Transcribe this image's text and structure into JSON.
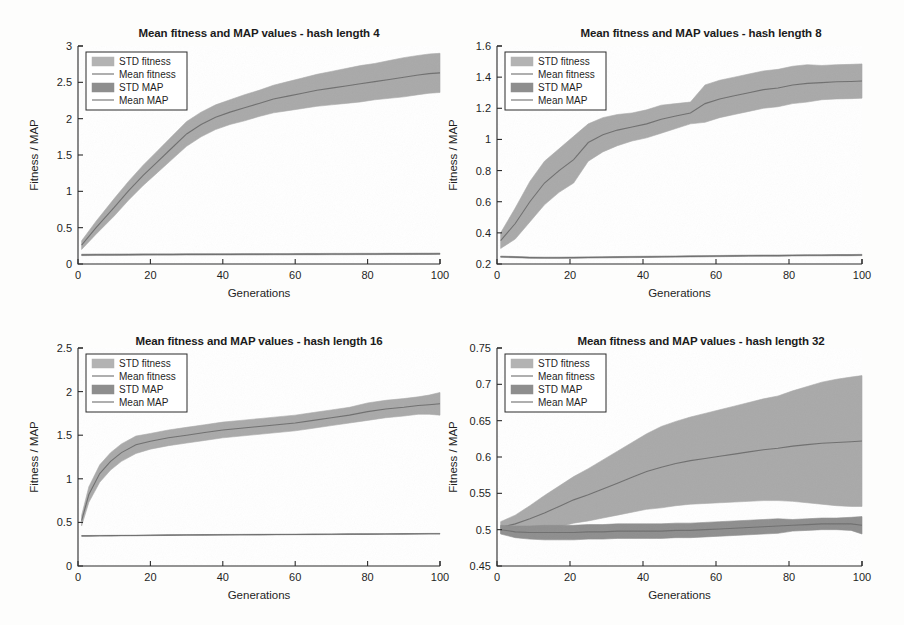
{
  "figure": {
    "background_color": "#fdfdfc",
    "panel_count": 4,
    "layout": "2x2 grid"
  },
  "style": {
    "band_fitness_color": "#a9a9a9",
    "band_map_color": "#8e8e8e",
    "mean_line_color": "#6f6f6f",
    "axis_color": "#2b2b2b",
    "plot_background": "#ffffff"
  },
  "legend": {
    "entries": [
      {
        "label": "STD fitness",
        "type": "patch",
        "color": "#b3b3b3"
      },
      {
        "label": "Mean fitness",
        "type": "line",
        "color": "#7a7a7a"
      },
      {
        "label": "STD MAP",
        "type": "patch",
        "color": "#8e8e8e"
      },
      {
        "label": "Mean MAP",
        "type": "line",
        "color": "#7a7a7a"
      }
    ],
    "position": "upper-left"
  },
  "chart_data": [
    {
      "id": "hash-length-4",
      "type": "area",
      "title": "Mean fitness and MAP values - hash length 4",
      "xlabel": "Generations",
      "ylabel": "Fitness / MAP",
      "xlim": [
        0,
        100
      ],
      "ylim": [
        0,
        3
      ],
      "xticks": [
        0,
        20,
        40,
        60,
        80,
        100
      ],
      "yticks": [
        0,
        0.5,
        1,
        1.5,
        2,
        2.5,
        3
      ],
      "grid": false,
      "x": [
        1,
        5,
        10,
        14,
        18,
        22,
        26,
        30,
        34,
        38,
        42,
        46,
        50,
        54,
        58,
        62,
        66,
        70,
        74,
        78,
        82,
        86,
        90,
        94,
        97,
        100
      ],
      "series": [
        {
          "name": "Mean fitness",
          "values": [
            0.26,
            0.5,
            0.78,
            1.01,
            1.22,
            1.41,
            1.6,
            1.79,
            1.92,
            2.02,
            2.09,
            2.15,
            2.21,
            2.27,
            2.31,
            2.35,
            2.39,
            2.42,
            2.45,
            2.48,
            2.51,
            2.54,
            2.57,
            2.6,
            2.62,
            2.63
          ],
          "std": [
            0.06,
            0.09,
            0.12,
            0.13,
            0.14,
            0.15,
            0.16,
            0.17,
            0.17,
            0.17,
            0.17,
            0.18,
            0.18,
            0.19,
            0.2,
            0.21,
            0.22,
            0.23,
            0.24,
            0.25,
            0.25,
            0.26,
            0.27,
            0.27,
            0.27,
            0.27
          ]
        },
        {
          "name": "Mean MAP",
          "values": [
            0.125,
            0.127,
            0.128,
            0.129,
            0.13,
            0.131,
            0.131,
            0.132,
            0.132,
            0.133,
            0.133,
            0.134,
            0.134,
            0.135,
            0.135,
            0.136,
            0.136,
            0.137,
            0.137,
            0.138,
            0.138,
            0.139,
            0.139,
            0.14,
            0.14,
            0.141
          ],
          "std": [
            0.01,
            0.01,
            0.01,
            0.01,
            0.01,
            0.009,
            0.009,
            0.009,
            0.009,
            0.009,
            0.009,
            0.009,
            0.009,
            0.009,
            0.009,
            0.009,
            0.009,
            0.009,
            0.009,
            0.009,
            0.009,
            0.009,
            0.009,
            0.009,
            0.009,
            0.009
          ]
        }
      ]
    },
    {
      "id": "hash-length-8",
      "type": "area",
      "title": "Mean fitness and MAP values - hash length 8",
      "xlabel": "Generations",
      "ylabel": "Fitness / MAP",
      "xlim": [
        0,
        100
      ],
      "ylim": [
        0.2,
        1.6
      ],
      "xticks": [
        0,
        20,
        40,
        60,
        80,
        100
      ],
      "yticks": [
        0.2,
        0.4,
        0.6,
        0.8,
        1,
        1.2,
        1.4,
        1.6
      ],
      "grid": false,
      "x": [
        1,
        5,
        9,
        13,
        17,
        21,
        25,
        29,
        33,
        37,
        41,
        45,
        49,
        53,
        57,
        61,
        65,
        69,
        73,
        77,
        81,
        85,
        89,
        93,
        97,
        100
      ],
      "series": [
        {
          "name": "Mean fitness",
          "values": [
            0.35,
            0.46,
            0.6,
            0.72,
            0.8,
            0.87,
            0.98,
            1.03,
            1.06,
            1.08,
            1.1,
            1.13,
            1.15,
            1.17,
            1.23,
            1.26,
            1.28,
            1.3,
            1.32,
            1.33,
            1.35,
            1.36,
            1.365,
            1.37,
            1.372,
            1.375
          ],
          "std": [
            0.05,
            0.1,
            0.13,
            0.14,
            0.14,
            0.15,
            0.12,
            0.11,
            0.1,
            0.09,
            0.09,
            0.09,
            0.08,
            0.07,
            0.12,
            0.12,
            0.12,
            0.12,
            0.12,
            0.12,
            0.12,
            0.12,
            0.11,
            0.11,
            0.11,
            0.11
          ]
        },
        {
          "name": "Mean MAP",
          "values": [
            0.247,
            0.244,
            0.241,
            0.24,
            0.24,
            0.241,
            0.242,
            0.243,
            0.244,
            0.245,
            0.246,
            0.247,
            0.248,
            0.249,
            0.25,
            0.251,
            0.252,
            0.253,
            0.254,
            0.254,
            0.255,
            0.256,
            0.256,
            0.257,
            0.257,
            0.258
          ]
        }
      ]
    },
    {
      "id": "hash-length-16",
      "type": "area",
      "title": "Mean fitness and MAP values - hash length 16",
      "xlabel": "Generations",
      "ylabel": "Fitness / MAP",
      "xlim": [
        0,
        100
      ],
      "ylim": [
        0,
        2.5
      ],
      "xticks": [
        0,
        20,
        40,
        60,
        80,
        100
      ],
      "yticks": [
        0,
        0.5,
        1,
        1.5,
        2,
        2.5
      ],
      "grid": false,
      "x": [
        1,
        3,
        6,
        9,
        12,
        16,
        20,
        25,
        30,
        35,
        40,
        45,
        50,
        55,
        60,
        65,
        70,
        75,
        80,
        85,
        90,
        94,
        97,
        100
      ],
      "series": [
        {
          "name": "Mean fitness",
          "values": [
            0.52,
            0.82,
            1.06,
            1.2,
            1.3,
            1.39,
            1.43,
            1.47,
            1.5,
            1.53,
            1.56,
            1.58,
            1.6,
            1.62,
            1.64,
            1.67,
            1.7,
            1.73,
            1.77,
            1.8,
            1.82,
            1.84,
            1.85,
            1.86
          ],
          "std": [
            0.06,
            0.09,
            0.1,
            0.1,
            0.1,
            0.1,
            0.09,
            0.09,
            0.09,
            0.09,
            0.09,
            0.09,
            0.09,
            0.09,
            0.09,
            0.09,
            0.09,
            0.09,
            0.1,
            0.1,
            0.1,
            0.1,
            0.11,
            0.13
          ]
        },
        {
          "name": "Mean MAP",
          "values": [
            0.345,
            0.346,
            0.347,
            0.348,
            0.349,
            0.35,
            0.352,
            0.354,
            0.356,
            0.357,
            0.358,
            0.359,
            0.36,
            0.361,
            0.362,
            0.363,
            0.364,
            0.365,
            0.366,
            0.367,
            0.368,
            0.369,
            0.37,
            0.37
          ]
        }
      ]
    },
    {
      "id": "hash-length-32",
      "type": "area",
      "title": "Mean fitness and MAP values - hash length 32",
      "xlabel": "Generations",
      "ylabel": "Fitness / MAP",
      "xlim": [
        0,
        100
      ],
      "ylim": [
        0.45,
        0.75
      ],
      "xticks": [
        0,
        20,
        40,
        60,
        80,
        100
      ],
      "yticks": [
        0.45,
        0.5,
        0.55,
        0.6,
        0.65,
        0.7,
        0.75
      ],
      "grid": false,
      "x": [
        1,
        5,
        9,
        13,
        17,
        21,
        25,
        29,
        33,
        37,
        41,
        45,
        49,
        53,
        57,
        61,
        65,
        69,
        73,
        77,
        81,
        85,
        89,
        93,
        97,
        100
      ],
      "series": [
        {
          "name": "Mean fitness",
          "values": [
            0.503,
            0.508,
            0.515,
            0.523,
            0.532,
            0.541,
            0.548,
            0.556,
            0.564,
            0.572,
            0.58,
            0.586,
            0.591,
            0.595,
            0.598,
            0.601,
            0.604,
            0.607,
            0.61,
            0.612,
            0.615,
            0.617,
            0.619,
            0.62,
            0.621,
            0.622
          ],
          "std": [
            0.008,
            0.012,
            0.018,
            0.024,
            0.028,
            0.032,
            0.036,
            0.04,
            0.044,
            0.048,
            0.052,
            0.056,
            0.058,
            0.06,
            0.062,
            0.064,
            0.066,
            0.068,
            0.07,
            0.072,
            0.076,
            0.08,
            0.084,
            0.087,
            0.089,
            0.09
          ]
        },
        {
          "name": "Mean MAP",
          "values": [
            0.5,
            0.497,
            0.496,
            0.496,
            0.496,
            0.496,
            0.497,
            0.497,
            0.498,
            0.498,
            0.498,
            0.498,
            0.499,
            0.499,
            0.5,
            0.501,
            0.502,
            0.503,
            0.504,
            0.505,
            0.506,
            0.507,
            0.508,
            0.508,
            0.508,
            0.506
          ],
          "std": [
            0.006,
            0.008,
            0.009,
            0.01,
            0.01,
            0.01,
            0.01,
            0.01,
            0.01,
            0.01,
            0.01,
            0.01,
            0.01,
            0.01,
            0.01,
            0.01,
            0.01,
            0.01,
            0.01,
            0.01,
            0.008,
            0.008,
            0.008,
            0.008,
            0.009,
            0.012
          ]
        }
      ]
    }
  ]
}
